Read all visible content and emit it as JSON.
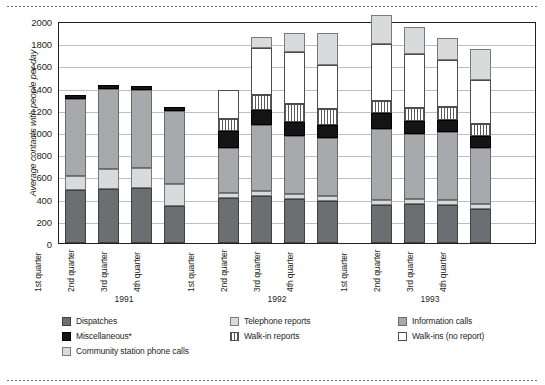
{
  "chart_data": {
    "type": "bar",
    "stacked": true,
    "title": "",
    "xlabel": "",
    "ylabel": "Average contacts with people per day",
    "ylim": [
      0,
      2000
    ],
    "ytick_labels": [
      "2000",
      "1800",
      "1600",
      "1400",
      "1200",
      "1000",
      "800",
      "600",
      "400",
      "200",
      "0"
    ],
    "yticks": [
      2000,
      1800,
      1600,
      1400,
      1200,
      1000,
      800,
      600,
      400,
      200,
      0
    ],
    "grid": true,
    "legend_position": "bottom",
    "categories": [
      "1st quarter",
      "2nd quarter",
      "3rd quarter",
      "4th quarter",
      "1st quarter",
      "2nd quarter",
      "3rd quarter",
      "4th quarter",
      "1st quarter",
      "2nd quarter",
      "3rd quarter",
      "4th quarter"
    ],
    "groups": [
      {
        "label": "1991",
        "span": 4
      },
      {
        "label": "1992",
        "span": 4
      },
      {
        "label": "1993",
        "span": 4
      }
    ],
    "series": [
      {
        "name": "Dispatches",
        "color": "#6d6e71",
        "values": [
          480,
          490,
          500,
          330,
          410,
          420,
          400,
          380,
          340,
          350,
          345,
          305
        ]
      },
      {
        "name": "Community station phone calls",
        "color": "#d9dadb",
        "values": [
          120,
          175,
          175,
          200,
          40,
          45,
          40,
          40,
          45,
          45,
          45,
          45
        ]
      },
      {
        "name": "Information calls",
        "color": "#a7a9ac",
        "values": [
          700,
          720,
          700,
          660,
          410,
          600,
          520,
          530,
          640,
          585,
          610,
          505
        ]
      },
      {
        "name": "Miscellaneous*",
        "color": "#141414",
        "values": [
          30,
          40,
          40,
          35,
          150,
          130,
          130,
          110,
          145,
          120,
          110,
          110
        ]
      },
      {
        "name": "Walk-in reports",
        "color": "#ffffff",
        "values": [
          0,
          0,
          0,
          0,
          105,
          140,
          160,
          145,
          110,
          115,
          120,
          110
        ]
      },
      {
        "name": "Walk-ins (no report)",
        "color": "#ffffff",
        "values": [
          0,
          0,
          0,
          0,
          265,
          420,
          470,
          400,
          510,
          490,
          415,
          390
        ]
      },
      {
        "name": "Telephone reports",
        "color": "#d9dadb",
        "values": [
          0,
          0,
          0,
          0,
          0,
          105,
          175,
          285,
          260,
          240,
          205,
          280
        ]
      }
    ],
    "totals": [
      1330,
      1425,
      1415,
      1225,
      1381,
      1860,
      1895,
      1890,
      1950,
      1945,
      1850,
      1745
    ],
    "annotations": []
  },
  "legend": {
    "items": [
      {
        "label": "Dispatches",
        "swatch": "dispatch"
      },
      {
        "label": "Miscellaneous*",
        "swatch": "misc"
      },
      {
        "label": "Community station phone calls",
        "swatch": "comm"
      },
      {
        "label": "Telephone reports",
        "swatch": "tel"
      },
      {
        "label": "Walk-in reports",
        "swatch": "walkinrep"
      },
      {
        "label": "Information calls",
        "swatch": "info"
      },
      {
        "label": "Walk-ins (no report)",
        "swatch": "walkin"
      }
    ]
  },
  "colors": {
    "dispatches": "#6d6e71",
    "miscellaneous": "#141414",
    "community_station": "#d9dadb",
    "telephone_reports": "#d9dadb",
    "walk_in_reports": "#ffffff",
    "information_calls": "#a7a9ac",
    "walk_ins_no_report": "#ffffff",
    "gridline": "#bcbec0",
    "axis": "#231f20"
  }
}
